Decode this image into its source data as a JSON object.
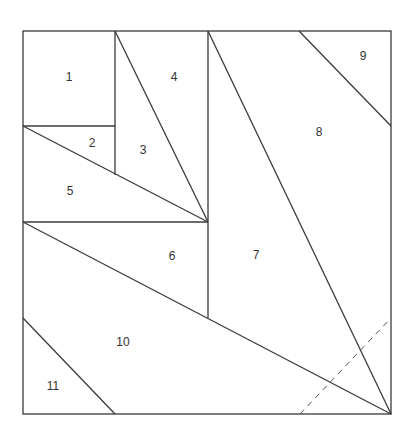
{
  "diagram": {
    "type": "quilt-block-piecing-diagram",
    "outer_square": {
      "x1": 23,
      "y1": 31,
      "x2": 391,
      "y2": 414
    },
    "pieces": [
      {
        "id": "1",
        "label": "1",
        "x": 69,
        "y": 78
      },
      {
        "id": "2",
        "label": "2",
        "x": 92,
        "y": 144
      },
      {
        "id": "3",
        "label": "3",
        "x": 143,
        "y": 151
      },
      {
        "id": "4",
        "label": "4",
        "x": 174,
        "y": 78
      },
      {
        "id": "5",
        "label": "5",
        "x": 70,
        "y": 192
      },
      {
        "id": "6",
        "label": "6",
        "x": 172,
        "y": 257
      },
      {
        "id": "7",
        "label": "7",
        "x": 256,
        "y": 256
      },
      {
        "id": "8",
        "label": "8",
        "x": 319,
        "y": 133
      },
      {
        "id": "9",
        "label": "9",
        "x": 363,
        "y": 57
      },
      {
        "id": "10",
        "label": "10",
        "x": 123,
        "y": 343
      },
      {
        "id": "11",
        "label": "11",
        "x": 53,
        "y": 387
      }
    ],
    "line_color": "#3a3a3a",
    "fold_line": "dashed"
  }
}
